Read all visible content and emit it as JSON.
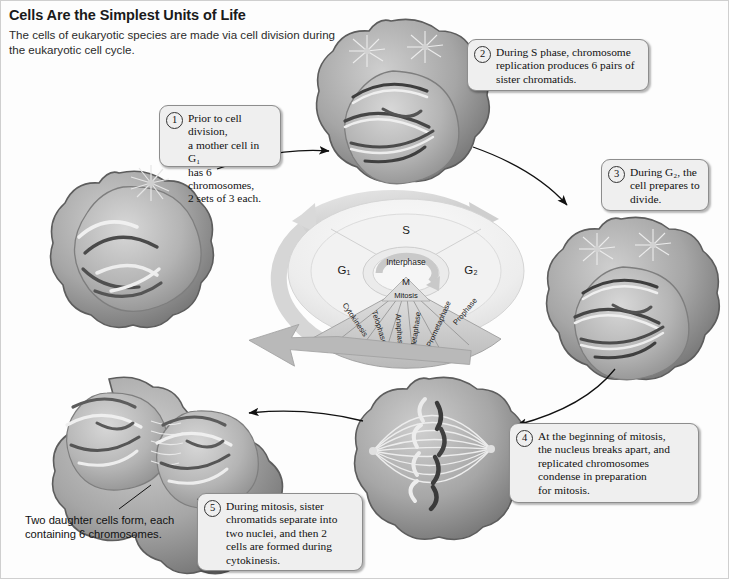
{
  "header": {
    "title": "Cells Are the Simplest Units of Life",
    "subtitle": "The cells of eukaryotic species are made via cell division during the eukaryotic cell cycle."
  },
  "callouts": [
    {
      "number": "1",
      "lines": [
        "Prior to cell division,",
        "a mother cell in G₁",
        "has 6 chromosomes,",
        "2 sets of 3 each."
      ]
    },
    {
      "number": "2",
      "lines": [
        "During S phase, chromosome",
        "replication produces 6 pairs of",
        "sister chromatids."
      ]
    },
    {
      "number": "3",
      "lines": [
        "During G₂, the",
        "cell prepares to",
        "divide."
      ]
    },
    {
      "number": "4",
      "lines": [
        "At the beginning of mitosis,",
        "the nucleus breaks apart, and",
        "replicated chromosomes",
        "condense in preparation",
        "for mitosis."
      ]
    },
    {
      "number": "5",
      "lines": [
        "During mitosis, sister",
        "chromatids separate into",
        "two nuclei, and then 2",
        "cells are formed during",
        "cytokinesis."
      ]
    }
  ],
  "caption": {
    "lines": [
      "Two daughter cells form, each",
      "containing 6 chromosomes."
    ]
  },
  "wheel": {
    "phase_s": "S",
    "phase_g1": "G₁",
    "phase_g2": "G₂",
    "interphase": "Interphase",
    "m": "M",
    "mitosis": "Mitosis",
    "stages": [
      "Cytokinesis",
      "Telophase",
      "Anaphase",
      "Metaphase",
      "Prometaphase",
      "Prophase"
    ]
  },
  "colors": {
    "callout_fill": "#efefef",
    "callout_border": "#8d8d8d",
    "cell_body": "#9a9a9a",
    "nucleus": "#bdbdbd",
    "chromosome_dark": "#3a3a3a",
    "wheel_outer": "#e8e8e8",
    "wheel_fan": "#cfcfcf",
    "arrow_gray": "#d2d2d2",
    "arrow_black": "#111111",
    "text": "#1a1a1a"
  }
}
